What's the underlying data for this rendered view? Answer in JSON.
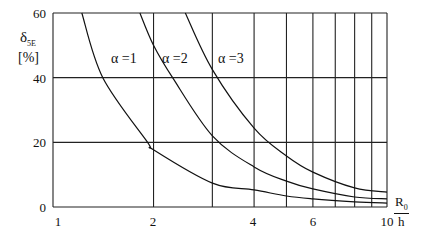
{
  "chart_data": {
    "type": "line",
    "title": "",
    "xlabel": {
      "numerator": "R",
      "numerator_sub": "0",
      "denominator": "h"
    },
    "ylabel": {
      "symbol": "δ",
      "sub": "5E",
      "unit": "[%]"
    },
    "xscale": "log",
    "xlim": [
      1,
      10
    ],
    "ylim": [
      0,
      60
    ],
    "grid": true,
    "x_tick_labels": [
      "1",
      "2",
      "4",
      "6",
      "10"
    ],
    "x_ticks": [
      1,
      2,
      4,
      6,
      10
    ],
    "x_gridlines": [
      2,
      3,
      4,
      5,
      6,
      7,
      8,
      9,
      10
    ],
    "y_tick_labels": [
      "0",
      "20",
      "40",
      "60"
    ],
    "y_ticks": [
      0,
      20,
      40,
      60
    ],
    "series": [
      {
        "name": "α =1",
        "x": [
          1.22,
          1.41,
          1.92,
          2,
          3,
          4,
          5,
          6,
          8,
          10
        ],
        "y": [
          60,
          40,
          20,
          17.7,
          7.4,
          5.3,
          3.4,
          2.5,
          1.6,
          1.2
        ]
      },
      {
        "name": "α =2",
        "x": [
          1.82,
          2,
          2.28,
          3,
          4,
          5,
          6,
          8,
          10
        ],
        "y": [
          60,
          50,
          40,
          22,
          12.4,
          8,
          5.6,
          3.1,
          2.5
        ]
      },
      {
        "name": "α =3",
        "x": [
          2.49,
          3,
          4,
          5,
          6,
          8,
          10
        ],
        "y": [
          60,
          42.5,
          24.4,
          15.8,
          10.8,
          5.9,
          4.6
        ]
      }
    ],
    "annotations": [
      {
        "text": "α =1",
        "x": 1.75,
        "y": 47
      },
      {
        "text": "α =2",
        "x": 2.3,
        "y": 47
      },
      {
        "text": "α =3",
        "x": 3.4,
        "y": 47
      }
    ]
  },
  "labels": {
    "y_symbol": "δ",
    "y_sub": "5E",
    "y_unit": "[%]",
    "x_num": "R",
    "x_num_sub": "0",
    "x_den": "h",
    "curve1": "α =1",
    "curve2": "α =2",
    "curve3": "α =3",
    "yt0": "0",
    "yt20": "20",
    "yt40": "40",
    "yt60": "60",
    "xt1": "1",
    "xt2": "2",
    "xt4": "4",
    "xt6": "6",
    "xt10": "10"
  }
}
